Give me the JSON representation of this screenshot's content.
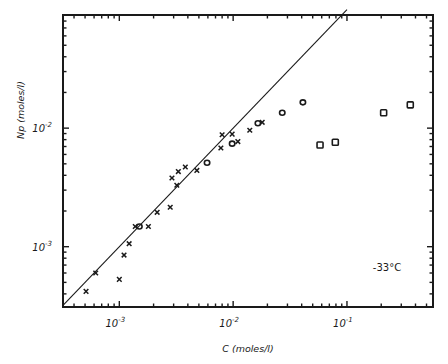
{
  "chart_data": {
    "type": "scatter",
    "title": "",
    "xlabel": "C (moles/l)",
    "ylabel": "Np (moles/l)",
    "xscale": "log",
    "yscale": "log",
    "xlim": [
      0.00032,
      0.57
    ],
    "ylim": [
      0.00031,
      0.09
    ],
    "x_ticks": [
      {
        "value": 0.001,
        "label_base": "10",
        "label_exp": "-3"
      },
      {
        "value": 0.01,
        "label_base": "10",
        "label_exp": "-2"
      },
      {
        "value": 0.1,
        "label_base": "10",
        "label_exp": "-1"
      }
    ],
    "y_ticks": [
      {
        "value": 0.001,
        "label_base": "10",
        "label_exp": "-3"
      },
      {
        "value": 0.01,
        "label_base": "10",
        "label_exp": "-2"
      }
    ],
    "grid": false,
    "legend": null,
    "annotations": [
      {
        "text": "-33°C",
        "x": 0.15,
        "y": 0.00068
      }
    ],
    "reference_line": {
      "name": "Np = C",
      "style": "solid",
      "from": [
        0.00032,
        0.00032
      ],
      "to": [
        0.1,
        0.1
      ]
    },
    "series": [
      {
        "name": "crosses",
        "marker": "x",
        "points": [
          [
            0.00051,
            0.00042
          ],
          [
            0.00062,
            0.0006
          ],
          [
            0.001,
            0.00053
          ],
          [
            0.0011,
            0.00085
          ],
          [
            0.00122,
            0.00106
          ],
          [
            0.00138,
            0.00148
          ],
          [
            0.0018,
            0.00148
          ],
          [
            0.00215,
            0.00195
          ],
          [
            0.0028,
            0.00215
          ],
          [
            0.0029,
            0.0038
          ],
          [
            0.0032,
            0.0033
          ],
          [
            0.0033,
            0.0043
          ],
          [
            0.0038,
            0.0047
          ],
          [
            0.0048,
            0.0044
          ],
          [
            0.0078,
            0.0068
          ],
          [
            0.008,
            0.0088
          ],
          [
            0.0098,
            0.0089
          ],
          [
            0.011,
            0.0077
          ],
          [
            0.014,
            0.0096
          ],
          [
            0.018,
            0.0112
          ]
        ]
      },
      {
        "name": "circles",
        "marker": "o",
        "points": [
          [
            0.0015,
            0.00148
          ],
          [
            0.0059,
            0.0051
          ],
          [
            0.0098,
            0.0074
          ],
          [
            0.0165,
            0.011
          ],
          [
            0.027,
            0.0135
          ],
          [
            0.041,
            0.0165
          ]
        ]
      },
      {
        "name": "squares",
        "marker": "s",
        "points": [
          [
            0.058,
            0.0072
          ],
          [
            0.079,
            0.0076
          ],
          [
            0.21,
            0.0135
          ],
          [
            0.36,
            0.0157
          ]
        ]
      }
    ]
  }
}
